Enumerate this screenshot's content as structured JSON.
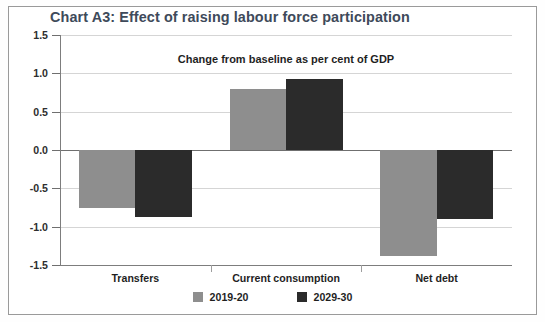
{
  "chart_data": {
    "type": "bar",
    "title": "Chart A3: Effect of raising labour force participation",
    "subtitle": "Change from baseline as per cent of GDP",
    "xlabel": "",
    "ylabel": "",
    "categories": [
      "Transfers",
      "Current consumption",
      "Net debt"
    ],
    "series": [
      {
        "name": "2019-20",
        "color": "#8e8e8e",
        "values": [
          -0.75,
          0.8,
          -1.38
        ]
      },
      {
        "name": "2029-30",
        "color": "#2b2b2b",
        "values": [
          -0.88,
          0.92,
          -0.9
        ]
      }
    ],
    "ylim": [
      -1.5,
      1.5
    ],
    "ytick_labels": [
      "1.5",
      "1.0",
      "0.5",
      "0.0",
      "-0.5",
      "-1.0",
      "-1.5"
    ],
    "ytick_values": [
      1.5,
      1.0,
      0.5,
      0.0,
      -0.5,
      -1.0,
      -1.5
    ],
    "grid": true,
    "legend_position": "bottom"
  }
}
